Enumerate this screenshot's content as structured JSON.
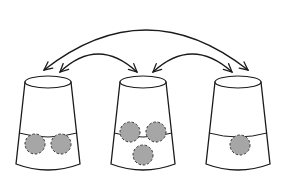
{
  "diagram": {
    "colors": {
      "line": "#1a1a1a",
      "ball_fill": "#a6a6a6",
      "background": "#ffffff"
    },
    "cups": [
      {
        "id": "cup-left",
        "ball_count": 2
      },
      {
        "id": "cup-middle",
        "ball_count": 3
      },
      {
        "id": "cup-right",
        "ball_count": 1
      }
    ],
    "arrows": [
      {
        "id": "swap-left-right",
        "from": "cup-left",
        "to": "cup-right",
        "type": "double-headed"
      },
      {
        "id": "swap-left-middle",
        "from": "cup-left",
        "to": "cup-middle",
        "type": "double-headed"
      },
      {
        "id": "swap-middle-right",
        "from": "cup-middle",
        "to": "cup-right",
        "type": "double-headed"
      }
    ]
  }
}
